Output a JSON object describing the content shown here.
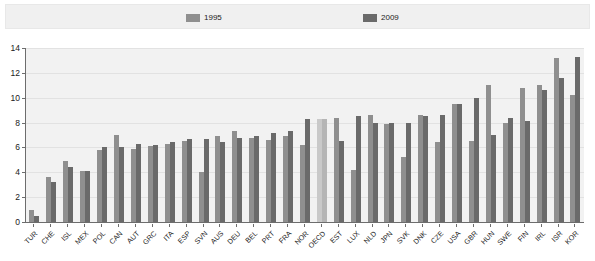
{
  "legend": {
    "items": [
      {
        "label": "1995",
        "color": "#8f8f8f"
      },
      {
        "label": "2009",
        "color": "#6a6a6a"
      }
    ]
  },
  "axis": {
    "y_ticks": [
      "0",
      "2",
      "4",
      "6",
      "8",
      "10",
      "12",
      "14"
    ]
  },
  "chart_data": {
    "type": "bar",
    "title": "",
    "subtitle": "",
    "xlabel": "",
    "ylabel": "",
    "ylim": [
      0,
      14
    ],
    "ytick_step": 2,
    "grid": true,
    "legend_position": "top",
    "highlight_category": "OECD",
    "categories": [
      "TUR",
      "CHE",
      "ISL",
      "MEX",
      "POL",
      "CAN",
      "AUT",
      "GRC",
      "ITA",
      "ESP",
      "SVN",
      "AUS",
      "DEU",
      "BEL",
      "PRT",
      "FRA",
      "NOR",
      "OECD",
      "EST",
      "LUX",
      "NLD",
      "JPN",
      "SVK",
      "DNK",
      "CZE",
      "USA",
      "GBR",
      "HUN",
      "SWE",
      "FIN",
      "IRL",
      "ISR",
      "KOR"
    ],
    "series": [
      {
        "name": "1995",
        "color": "#8f8f8f",
        "values": [
          1.0,
          3.6,
          4.9,
          4.1,
          5.8,
          7.0,
          5.9,
          6.1,
          6.3,
          6.5,
          4.0,
          6.9,
          7.3,
          6.8,
          6.6,
          6.9,
          6.2,
          8.3,
          8.4,
          4.2,
          8.6,
          7.9,
          5.2,
          8.6,
          6.4,
          9.5,
          6.5,
          11.0,
          8.0,
          10.8,
          11.0,
          13.2,
          10.2
        ]
      },
      {
        "name": "2009",
        "color": "#6a6a6a",
        "values": [
          0.5,
          3.2,
          4.4,
          4.1,
          6.0,
          6.0,
          6.3,
          6.2,
          6.4,
          6.7,
          6.7,
          6.4,
          6.8,
          6.9,
          7.2,
          7.3,
          8.3,
          8.3,
          6.5,
          8.5,
          8.0,
          8.0,
          8.0,
          8.5,
          8.6,
          9.5,
          10.0,
          7.0,
          8.4,
          8.1,
          10.6,
          11.6,
          13.3
        ]
      }
    ]
  }
}
